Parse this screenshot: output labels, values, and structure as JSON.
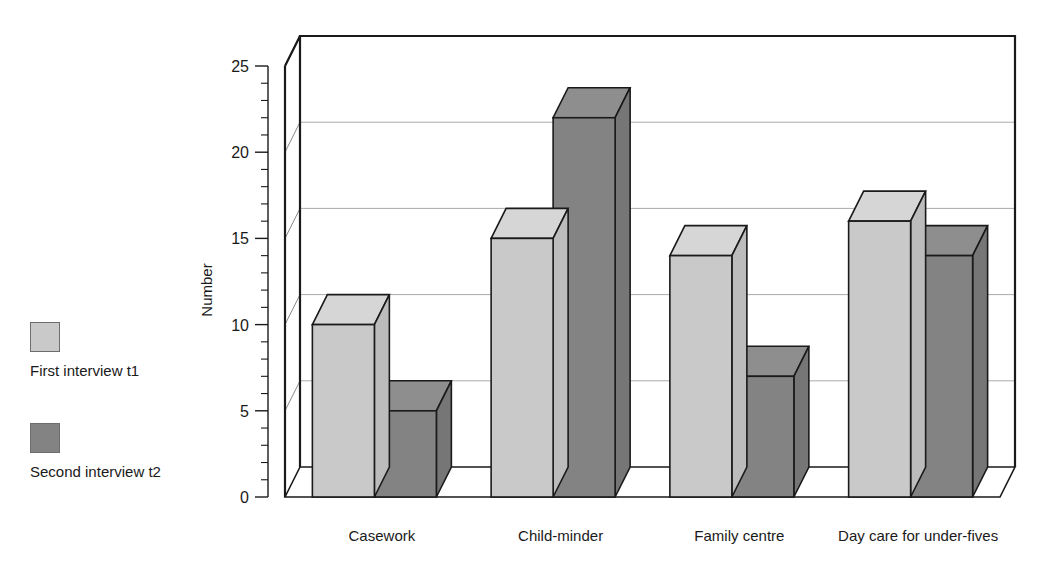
{
  "chart_data": {
    "type": "bar",
    "title": "",
    "xlabel": "",
    "ylabel": "Number",
    "ylim": [
      0,
      25
    ],
    "yticks": [
      0,
      5,
      10,
      15,
      20,
      25
    ],
    "ytick_labels": [
      "0",
      "5",
      "10",
      "15",
      "20",
      "25"
    ],
    "minor_tick_interval": 1,
    "grid": "horizontal",
    "style": "3d-grouped-bar",
    "legend_position": "left",
    "categories": [
      "Casework",
      "Child-minder",
      "Family centre",
      "Day care for under-fives"
    ],
    "series": [
      {
        "name": "First interview t1",
        "color": "#c9c9c9",
        "values": [
          10,
          15,
          14,
          16
        ]
      },
      {
        "name": "Second interview t2",
        "color": "#838383",
        "values": [
          5,
          22,
          7,
          14
        ]
      }
    ]
  },
  "axis": {
    "y_title": "Number",
    "tick_labels": [
      "25",
      "20",
      "15",
      "10",
      "5",
      "0"
    ]
  },
  "legend": {
    "entries": [
      {
        "label": "First interview t1",
        "color": "#c9c9c9"
      },
      {
        "label": "Second interview t2",
        "color": "#838383"
      }
    ]
  },
  "categories": [
    {
      "label": "Casework"
    },
    {
      "label": "Child-minder"
    },
    {
      "label": "Family centre"
    },
    {
      "label": "Day care for under-fives"
    }
  ],
  "colors": {
    "series_light": "#c9c9c9",
    "series_dark": "#838383",
    "outline": "#1a1a1a",
    "gridline": "#aaaaaa",
    "background": "#ffffff"
  }
}
